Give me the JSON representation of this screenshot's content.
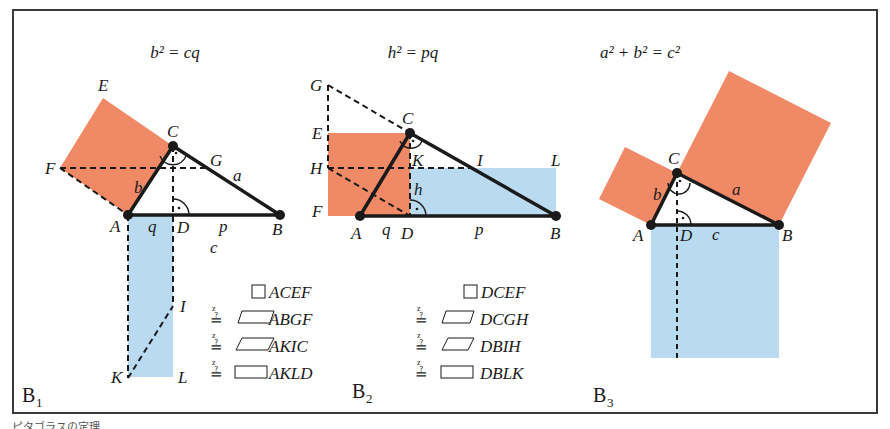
{
  "colors": {
    "orange": "#f08a66",
    "blue": "#b9daf1",
    "line": "#1a1a1a",
    "frame": "#3a3a3a"
  },
  "panels": [
    {
      "id": "B1",
      "tag": "B",
      "tag_sub": "1",
      "formula": "b² = cq",
      "points": {
        "A": "A",
        "B": "B",
        "C": "C",
        "D": "D",
        "E": "E",
        "F": "F",
        "G": "G",
        "I": "I",
        "K": "K",
        "L": "L"
      },
      "sides": {
        "a": "a",
        "b": "b",
        "c": "c",
        "p": "p",
        "q": "q"
      },
      "equalities": [
        {
          "prefix": "",
          "shape": "square",
          "name": "ACEF"
        },
        {
          "prefix": "≟",
          "shape": "parallelogram",
          "name": "ABGF"
        },
        {
          "prefix": "≟",
          "shape": "parallelogram",
          "name": "AKIC"
        },
        {
          "prefix": "≟",
          "shape": "rectangle",
          "name": "AKLD"
        }
      ]
    },
    {
      "id": "B2",
      "tag": "B",
      "tag_sub": "2",
      "formula": "h² = pq",
      "points": {
        "A": "A",
        "B": "B",
        "C": "C",
        "D": "D",
        "E": "E",
        "F": "F",
        "G": "G",
        "H": "H",
        "I": "I",
        "K": "K",
        "L": "L"
      },
      "sides": {
        "h": "h",
        "p": "p",
        "q": "q"
      },
      "equalities": [
        {
          "prefix": "",
          "shape": "square",
          "name": "DCEF"
        },
        {
          "prefix": "≟",
          "shape": "parallelogram",
          "name": "DCGH"
        },
        {
          "prefix": "≟",
          "shape": "parallelogram",
          "name": "DBIH"
        },
        {
          "prefix": "≟",
          "shape": "rectangle",
          "name": "DBLK"
        }
      ]
    },
    {
      "id": "B3",
      "tag": "B",
      "tag_sub": "3",
      "formula": "a² + b² = c²",
      "points": {
        "A": "A",
        "B": "B",
        "C": "C",
        "D": "D"
      },
      "sides": {
        "a": "a",
        "b": "b",
        "c": "c"
      }
    }
  ],
  "equal_sign_mark": "z",
  "caption": "ピタゴラスの定理"
}
